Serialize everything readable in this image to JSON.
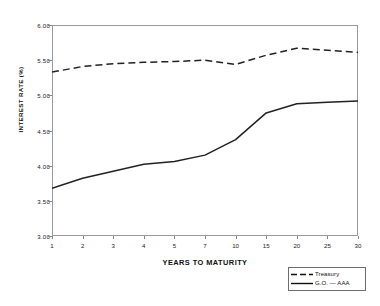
{
  "chart_data": {
    "type": "line",
    "title": "",
    "subtitle": "",
    "xlabel": "YEARS TO MATURITY",
    "ylabel": "INTEREST RATE (%)",
    "categories": [
      "1",
      "2",
      "3",
      "4",
      "5",
      "7",
      "10",
      "15",
      "20",
      "25",
      "30"
    ],
    "x_tick_labels": [
      "1",
      "2",
      "3",
      "4",
      "5",
      "7",
      "10",
      "15",
      "20",
      "25",
      "30"
    ],
    "y_tick_labels": [
      "6.00",
      "5.50",
      "5.00",
      "4.50",
      "4.00",
      "3.50",
      "3.00"
    ],
    "y_ticks": [
      6.0,
      5.5,
      5.0,
      4.5,
      4.0,
      3.5,
      3.0
    ],
    "ylim": [
      3.0,
      6.0
    ],
    "grid": false,
    "legend_position": "bottom-right",
    "series": [
      {
        "name": "Treasury",
        "style": "dashed",
        "color": "#222222",
        "values": [
          5.33,
          5.41,
          5.45,
          5.47,
          5.48,
          5.5,
          5.44,
          5.57,
          5.67,
          5.64,
          5.61
        ]
      },
      {
        "name": "G.O. — AAA",
        "style": "solid",
        "color": "#222222",
        "values": [
          3.68,
          3.82,
          3.92,
          4.02,
          4.06,
          4.15,
          4.37,
          4.75,
          4.88,
          4.9,
          4.92
        ]
      }
    ]
  },
  "legend": {
    "entries": [
      {
        "label": "Treasury",
        "style": "dashed"
      },
      {
        "label": "G.O. — AAA",
        "style": "solid"
      }
    ]
  }
}
